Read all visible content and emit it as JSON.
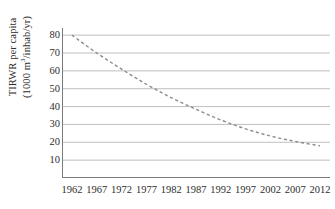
{
  "chart_data": {
    "type": "line",
    "title": "",
    "subtitle": "",
    "xlabel": "",
    "ylabel_line1": "TIRWR per capita",
    "ylabel_line2_prefix": "(1000 m",
    "ylabel_line2_sup": "3",
    "ylabel_line2_suffix": "/inhab/yr)",
    "ylabel_full": "TIRWR per capita (1000 m3/inhab/yr)",
    "x": [
      1962,
      1967,
      1972,
      1977,
      1982,
      1987,
      1992,
      1997,
      2002,
      2007,
      2012
    ],
    "xtick_labels": [
      "1962",
      "1967",
      "1972",
      "1977",
      "1982",
      "1987",
      "1992",
      "1997",
      "2002",
      "2007",
      "2012"
    ],
    "ytick_labels": [
      "80",
      "70",
      "60",
      "50",
      "40",
      "30",
      "20",
      "10"
    ],
    "ytick_values": [
      80,
      70,
      60,
      50,
      40,
      30,
      20,
      10
    ],
    "xlim": [
      1960,
      2014
    ],
    "ylim": [
      0,
      84
    ],
    "grid": "horizontal",
    "legend": "none",
    "series": [
      {
        "name": "TIRWR per capita",
        "linestyle": "dashed",
        "color": "#8c8c8c",
        "marker": "none",
        "values": [
          80.0,
          70.0,
          61.0,
          52.5,
          45.0,
          38.5,
          32.5,
          27.5,
          23.5,
          20.5,
          18.0
        ]
      }
    ],
    "annotations": []
  },
  "style": {
    "grid_color": "#b8b8b8",
    "axis_color": "#7a7a7a",
    "line_color": "#8c8c8c",
    "text_color": "#2e2e2e",
    "background": "#ffffff"
  }
}
